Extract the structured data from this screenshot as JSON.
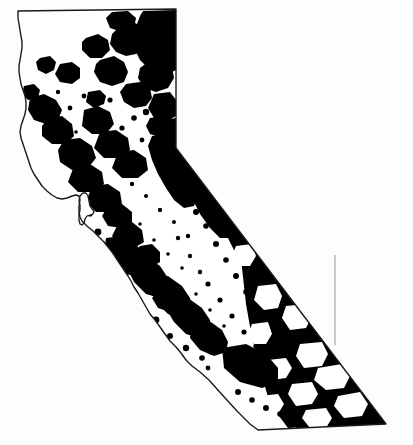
{
  "figure": {
    "kind": "thematic-distribution-map",
    "title": "",
    "caption": "",
    "background_color": "#fdfdfd",
    "outline_color": "#1a1a1a",
    "fill_color": "#000000",
    "land_color": "#ffffff",
    "outline_width_px": 1.4,
    "width_px": 413,
    "height_px": 445,
    "legend": {
      "present": false,
      "items": []
    },
    "labels": [],
    "scale_bar": {
      "present": false,
      "text": ""
    },
    "north_arrow": {
      "present": false,
      "text": ""
    }
  },
  "map": {
    "state_outline_path": "M 18,11 L 176,9 L 176,148 L 386,424 L 258,430 L 250,424 L 237,411 L 226,399 L 217,389 L 209,380 L 200,372 L 192,366 L 186,360 L 181,353 L 176,347 L 170,341 L 165,334 L 160,327 L 155,320 L 150,314 L 146,307 L 142,300 L 138,293 L 134,287 L 131,281 L 128,276 L 124,270 L 120,264 L 116,258 L 112,252 L 108,247 L 104,242 L 100,238 L 96,234 L 92,230 L 88,227 L 85,224 L 82,221 L 80,217 L 79,212 L 79,206 L 80,200 L 79,196 L 76,195 L 72,196 L 67,198 L 62,199 L 57,198 L 52,195 L 47,191 L 42,186 L 38,180 L 34,174 L 31,168 L 29,162 L 27,156 L 25,150 L 23,144 L 21,138 L 20,132 L 21,126 L 23,120 L 25,114 L 26,108 L 26,102 L 25,96 L 23,90 L 21,84 L 20,78 L 19,72 L 19,66 L 20,60 L 21,54 L 22,48 L 22,42 L 21,36 L 20,30 L 19,24 L 18,18 Z",
    "sf_bay_path": "M 80,196 L 83,193 L 86,193 L 88,196 L 89,201 L 90,206 L 92,209 L 94,211 L 93,214 L 90,215 L 87,216 L 85,219 L 84,223 L 82,225 L 80,224 L 79,220 L 79,215 L 80,210 L 80,205 L 79,201 Z",
    "nevada_arizona_divider": "M 335,255 L 335,345",
    "regions": [
      {
        "name": "modoc-plateau-northeast",
        "coverage": "heavy"
      },
      {
        "name": "klamath-mountains-northwest",
        "coverage": "moderate"
      },
      {
        "name": "cascade-range-north",
        "coverage": "moderate"
      },
      {
        "name": "sierra-nevada-spine",
        "coverage": "heavy"
      },
      {
        "name": "coast-ranges",
        "coverage": "light-speckled"
      },
      {
        "name": "central-valley",
        "coverage": "absent"
      },
      {
        "name": "transverse-ranges-south",
        "coverage": "moderate"
      },
      {
        "name": "mojave-desert",
        "coverage": "heavy"
      },
      {
        "name": "colorado-desert-southeast",
        "coverage": "heavy"
      },
      {
        "name": "los-angeles-basin",
        "coverage": "absent"
      },
      {
        "name": "owens-valley",
        "coverage": "patchy"
      }
    ]
  }
}
